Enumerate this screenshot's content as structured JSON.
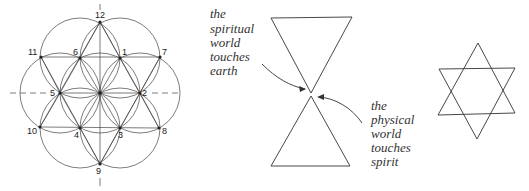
{
  "figure_1": {
    "title": "flower-of-life-construction",
    "center": [
      100,
      93
    ],
    "radius": 40,
    "points": [
      {
        "label": "1",
        "x": 120,
        "y": 58,
        "lx": 122,
        "ly": 55
      },
      {
        "label": "2",
        "x": 140,
        "y": 93,
        "lx": 142,
        "ly": 96
      },
      {
        "label": "3",
        "x": 120,
        "y": 128,
        "lx": 118,
        "ly": 138
      },
      {
        "label": "4",
        "x": 80,
        "y": 128,
        "lx": 74,
        "ly": 138
      },
      {
        "label": "5",
        "x": 60,
        "y": 93,
        "lx": 50,
        "ly": 96
      },
      {
        "label": "6",
        "x": 80,
        "y": 58,
        "lx": 73,
        "ly": 55
      },
      {
        "label": "7",
        "x": 160,
        "y": 57,
        "lx": 162,
        "ly": 55
      },
      {
        "label": "8",
        "x": 159,
        "y": 128,
        "lx": 162,
        "ly": 134
      },
      {
        "label": "9",
        "x": 100,
        "y": 164,
        "lx": 96,
        "ly": 174
      },
      {
        "label": "10",
        "x": 40,
        "y": 127,
        "lx": 27,
        "ly": 134
      },
      {
        "label": "11",
        "x": 41,
        "y": 57,
        "lx": 28,
        "ly": 55
      },
      {
        "label": "12",
        "x": 100,
        "y": 22,
        "lx": 95,
        "ly": 18
      }
    ]
  },
  "figure_2": {
    "title": "hourglass-triangles",
    "caption_left": [
      "the",
      "spiritual",
      "world",
      "touches",
      "earth"
    ],
    "caption_right": [
      "the",
      "physical",
      "world",
      "touches",
      "spirit"
    ]
  },
  "figure_3": {
    "title": "hexagram-star"
  }
}
